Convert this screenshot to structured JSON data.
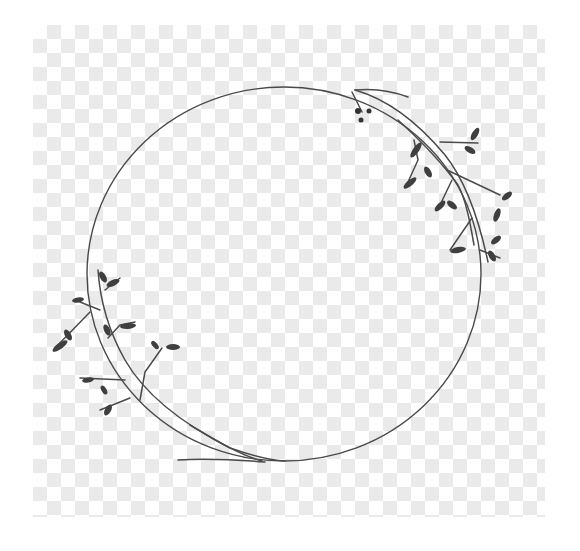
{
  "image": {
    "description": "Hand-drawn circular botanical wreath with leafy branches on a transparency checkerboard",
    "width": 580,
    "height": 551
  },
  "colors": {
    "background": "#ffffff",
    "checker_light": "#ffffff",
    "checker_dark": "#e8e8e8",
    "line": "#4a4a4a",
    "leaf": "#3f3f3f"
  },
  "checkerboard": {
    "x": 33,
    "y": 25,
    "width": 512,
    "height": 492,
    "cell": 14
  },
  "wreath": {
    "ring": {
      "cx": 284,
      "cy": 274,
      "rx": 197,
      "ry": 187
    },
    "branches": [
      {
        "name": "top-right-branch",
        "d": "M355 90 C 390 100, 420 125, 445 155 C 465 180, 478 215, 488 262"
      },
      {
        "name": "top-right-twig-upper",
        "d": "M355 90 C 375 88, 395 92, 408 97"
      },
      {
        "name": "top-right-twig-berries",
        "d": "M352 92 L 362 112"
      },
      {
        "name": "top-right-sub-branch",
        "d": "M398 120 C 420 140, 440 160, 458 185 C 466 200, 470 222, 474 245"
      },
      {
        "name": "top-right-twig-a",
        "d": "M440 142 L 478 143"
      },
      {
        "name": "top-right-twig-b",
        "d": "M414 140 L 418 160 L 408 182"
      },
      {
        "name": "top-right-twig-c",
        "d": "M447 170 L 500 195"
      },
      {
        "name": "top-right-twig-d",
        "d": "M452 180 L 440 205"
      },
      {
        "name": "top-right-twig-e",
        "d": "M472 218 L 450 250"
      },
      {
        "name": "top-right-twig-f",
        "d": "M480 250 L 500 258"
      },
      {
        "name": "bottom-left-branch",
        "d": "M98 270 C 100 300, 108 330, 125 360 C 145 395, 185 425, 230 448 C 250 455, 270 460, 285 461"
      },
      {
        "name": "bottom-left-twig-a",
        "d": "M90 312 L 55 348"
      },
      {
        "name": "bottom-left-twig-b",
        "d": "M100 310 L 75 300"
      },
      {
        "name": "bottom-left-twig-c",
        "d": "M105 290 L 120 278"
      },
      {
        "name": "bottom-left-twig-d",
        "d": "M108 338 L 120 325 L 135 322"
      },
      {
        "name": "bottom-left-twig-e",
        "d": "M140 400 L 145 372 L 162 348"
      },
      {
        "name": "bottom-left-twig-f",
        "d": "M125 380 L 80 378"
      },
      {
        "name": "bottom-left-twig-g",
        "d": "M130 398 L 100 410"
      },
      {
        "name": "bottom-twig-long-a",
        "d": "M190 425 C 215 440, 240 455, 262 461"
      },
      {
        "name": "bottom-twig-long-b",
        "d": "M178 460 C 210 458, 240 460, 265 462"
      }
    ],
    "leaves": [
      {
        "cx": 416,
        "cy": 150,
        "rx": 9,
        "ry": 3,
        "rot": -55
      },
      {
        "cx": 475,
        "cy": 134,
        "rx": 7,
        "ry": 3,
        "rot": -60
      },
      {
        "cx": 470,
        "cy": 150,
        "rx": 6,
        "ry": 3,
        "rot": 30
      },
      {
        "cx": 410,
        "cy": 183,
        "rx": 8,
        "ry": 3,
        "rot": -40
      },
      {
        "cx": 428,
        "cy": 172,
        "rx": 6,
        "ry": 3,
        "rot": 60
      },
      {
        "cx": 440,
        "cy": 206,
        "rx": 7,
        "ry": 3,
        "rot": -45
      },
      {
        "cx": 452,
        "cy": 205,
        "rx": 6,
        "ry": 3,
        "rot": 40
      },
      {
        "cx": 497,
        "cy": 215,
        "rx": 7,
        "ry": 3,
        "rot": -70
      },
      {
        "cx": 507,
        "cy": 196,
        "rx": 6,
        "ry": 3,
        "rot": -40
      },
      {
        "cx": 496,
        "cy": 240,
        "rx": 6,
        "ry": 3,
        "rot": -40
      },
      {
        "cx": 458,
        "cy": 250,
        "rx": 8,
        "ry": 3,
        "rot": -10
      },
      {
        "cx": 492,
        "cy": 256,
        "rx": 6,
        "ry": 3,
        "rot": 60
      },
      {
        "cx": 60,
        "cy": 346,
        "rx": 9,
        "ry": 3,
        "rot": -35
      },
      {
        "cx": 68,
        "cy": 335,
        "rx": 6,
        "ry": 3,
        "rot": 60
      },
      {
        "cx": 78,
        "cy": 300,
        "rx": 6,
        "ry": 2.5,
        "rot": -10
      },
      {
        "cx": 103,
        "cy": 277,
        "rx": 6,
        "ry": 3,
        "rot": 60
      },
      {
        "cx": 113,
        "cy": 283,
        "rx": 7,
        "ry": 3,
        "rot": -25
      },
      {
        "cx": 107,
        "cy": 330,
        "rx": 6,
        "ry": 3,
        "rot": 65
      },
      {
        "cx": 128,
        "cy": 326,
        "rx": 8,
        "ry": 3,
        "rot": -5
      },
      {
        "cx": 155,
        "cy": 345,
        "rx": 5,
        "ry": 2.5,
        "rot": 50
      },
      {
        "cx": 173,
        "cy": 347,
        "rx": 7,
        "ry": 3,
        "rot": 0
      },
      {
        "cx": 88,
        "cy": 380,
        "rx": 6,
        "ry": 2.5,
        "rot": -10
      },
      {
        "cx": 104,
        "cy": 390,
        "rx": 5,
        "ry": 2.5,
        "rot": 60
      },
      {
        "cx": 108,
        "cy": 410,
        "rx": 6,
        "ry": 3,
        "rot": -60
      }
    ],
    "berries": [
      {
        "cx": 358,
        "cy": 111,
        "r": 3
      },
      {
        "cx": 369,
        "cy": 111,
        "r": 2.5
      },
      {
        "cx": 361,
        "cy": 120,
        "r": 2.5
      }
    ]
  }
}
